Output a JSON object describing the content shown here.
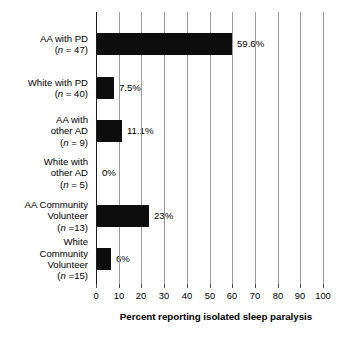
{
  "chart_data": {
    "type": "bar",
    "orientation": "horizontal",
    "title": "",
    "subtitle": "",
    "xlabel": "Percent reporting isolated sleep paralysis",
    "ylabel": "",
    "xlim": [
      0,
      100
    ],
    "xticks": [
      0,
      10,
      20,
      30,
      40,
      50,
      60,
      70,
      80,
      90,
      100
    ],
    "xtick_labels": [
      "0",
      "10",
      "20",
      "30",
      "40",
      "50",
      "60",
      "70",
      "80",
      "90",
      "100"
    ],
    "grid": "vertical gridlines at every x tick",
    "legend": "none",
    "bar_color": "#0d0d0d",
    "categories": [
      "AA with PD (n = 47)",
      "White with PD (n = 40)",
      "AA with other AD (n = 9)",
      "White with other AD (n = 5)",
      "AA Community Volunteer (n =13)",
      "White Community Volunteer (n =15)"
    ],
    "values": [
      59.6,
      7.5,
      11.1,
      0,
      23,
      6
    ],
    "value_labels": [
      "59.6%",
      "7.5%",
      "11.1%",
      "0%",
      "23%",
      "6%"
    ],
    "group_sizes": [
      47,
      40,
      9,
      5,
      13,
      15
    ]
  },
  "rows": [
    {
      "lines": [
        "AA with PD"
      ],
      "n_line": "(n = 47)",
      "n_prefix": "(",
      "n_italic": "n",
      "n_rest": " = 47)",
      "value": 59.6,
      "value_label": "59.6%"
    },
    {
      "lines": [
        "White with PD"
      ],
      "n_line": "(n = 40)",
      "n_prefix": "(",
      "n_italic": "n",
      "n_rest": " = 40)",
      "value": 7.5,
      "value_label": "7.5%"
    },
    {
      "lines": [
        "AA with",
        "other AD"
      ],
      "n_line": "(n = 9)",
      "n_prefix": "(",
      "n_italic": "n",
      "n_rest": " = 9)",
      "value": 11.1,
      "value_label": "11.1%"
    },
    {
      "lines": [
        "White with",
        "other AD"
      ],
      "n_line": "(n = 5)",
      "n_prefix": "(",
      "n_italic": "n",
      "n_rest": " = 5)",
      "value": 0,
      "value_label": "0%"
    },
    {
      "lines": [
        "AA Community",
        "Volunteer"
      ],
      "n_line": "(n =13)",
      "n_prefix": "(",
      "n_italic": "n",
      "n_rest": " =13)",
      "value": 23,
      "value_label": "23%"
    },
    {
      "lines": [
        "White",
        "Community",
        "Volunteer"
      ],
      "n_line": "(n =15)",
      "n_prefix": "(",
      "n_italic": "n",
      "n_rest": " =15)",
      "value": 6,
      "value_label": "6%"
    }
  ],
  "axis": {
    "title": "Percent reporting isolated sleep paralysis",
    "ticks": [
      "0",
      "10",
      "20",
      "30",
      "40",
      "50",
      "60",
      "70",
      "80",
      "90",
      "100"
    ]
  }
}
